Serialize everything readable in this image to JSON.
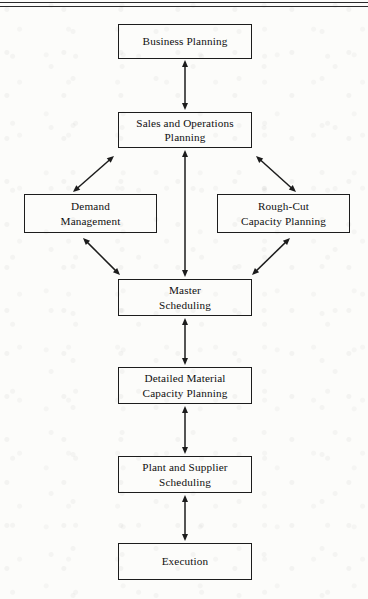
{
  "page": {
    "background_color": "#fcfcfa",
    "ink_color": "#101010",
    "line_color": "#1c1c1c",
    "width": 368,
    "height": 599
  },
  "header_rules": [
    {
      "name": "top-rule-outer",
      "y": 2
    },
    {
      "name": "top-rule-inner",
      "y": 6
    }
  ],
  "diagram": {
    "type": "flowchart",
    "orientation": "top-to-bottom",
    "nodes": [
      {
        "id": "business-planning",
        "label": "Business Planning",
        "x": 118,
        "y": 24,
        "w": 134,
        "h": 35
      },
      {
        "id": "sales-and-operations-planning",
        "label": "Sales and Operations\nPlanning",
        "x": 118,
        "y": 112,
        "w": 134,
        "h": 36
      },
      {
        "id": "demand-management",
        "label": "Demand\nManagement",
        "x": 24,
        "y": 194,
        "w": 133,
        "h": 39
      },
      {
        "id": "rough-cut-capacity-planning",
        "label": "Rough-Cut\nCapacity Planning",
        "x": 217,
        "y": 194,
        "w": 133,
        "h": 39
      },
      {
        "id": "master-scheduling",
        "label": "Master\nScheduling",
        "x": 118,
        "y": 279,
        "w": 134,
        "h": 37
      },
      {
        "id": "detailed-material-capacity-planning",
        "label": "Detailed Material\nCapacity Planning",
        "x": 118,
        "y": 367,
        "w": 134,
        "h": 37
      },
      {
        "id": "plant-and-supplier-scheduling",
        "label": "Plant and Supplier\nScheduling",
        "x": 118,
        "y": 456,
        "w": 134,
        "h": 37
      },
      {
        "id": "execution",
        "label": "Execution",
        "x": 118,
        "y": 543,
        "w": 134,
        "h": 37
      }
    ],
    "edges": [
      {
        "id": "edge-business-planning-sop",
        "from": "business-planning",
        "to": "sales-and-operations-planning",
        "direction": "bidirectional",
        "x1": 185,
        "y1": 60,
        "x2": 185,
        "y2": 110
      },
      {
        "id": "edge-sop-demand-management",
        "from": "sales-and-operations-planning",
        "to": "demand-management",
        "direction": "bidirectional",
        "x1": 114,
        "y1": 156,
        "x2": 73,
        "y2": 192
      },
      {
        "id": "edge-sop-rough-cut",
        "from": "sales-and-operations-planning",
        "to": "rough-cut-capacity-planning",
        "direction": "bidirectional",
        "x1": 256,
        "y1": 156,
        "x2": 296,
        "y2": 192
      },
      {
        "id": "edge-sop-master-scheduling",
        "from": "sales-and-operations-planning",
        "to": "master-scheduling",
        "direction": "bidirectional",
        "x1": 185,
        "y1": 150,
        "x2": 185,
        "y2": 277
      },
      {
        "id": "edge-demand-management-master-scheduling",
        "from": "demand-management",
        "to": "master-scheduling",
        "direction": "bidirectional",
        "x1": 83,
        "y1": 238,
        "x2": 120,
        "y2": 275
      },
      {
        "id": "edge-rough-cut-master-scheduling",
        "from": "rough-cut-capacity-planning",
        "to": "master-scheduling",
        "direction": "bidirectional",
        "x1": 290,
        "y1": 238,
        "x2": 252,
        "y2": 275
      },
      {
        "id": "edge-master-scheduling-detailed-material",
        "from": "master-scheduling",
        "to": "detailed-material-capacity-planning",
        "direction": "bidirectional",
        "x1": 185,
        "y1": 318,
        "x2": 185,
        "y2": 365
      },
      {
        "id": "edge-detailed-material-plant-supplier",
        "from": "detailed-material-capacity-planning",
        "to": "plant-and-supplier-scheduling",
        "direction": "bidirectional",
        "x1": 185,
        "y1": 406,
        "x2": 185,
        "y2": 454
      },
      {
        "id": "edge-plant-supplier-execution",
        "from": "plant-and-supplier-scheduling",
        "to": "execution",
        "direction": "bidirectional",
        "x1": 185,
        "y1": 495,
        "x2": 185,
        "y2": 541
      }
    ]
  }
}
